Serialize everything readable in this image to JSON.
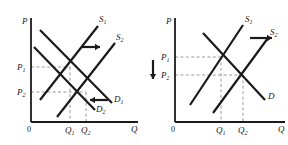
{
  "figure": {
    "type": "supply-demand-diagram-pair",
    "stroke_color": "#1a1a1a",
    "dashed_color": "#9a9a9a",
    "background": "#ffffff"
  },
  "chart_data": {
    "type": "line",
    "title": "",
    "panels": [
      {
        "name": "left-panel",
        "xlabel": "Q",
        "ylabel": "P",
        "origin_label": "0",
        "axis": {
          "x_min": 31,
          "x_max": 138,
          "y_min": 18,
          "y_max": 122
        },
        "price_ticks": [
          {
            "label": "P",
            "sub": "1",
            "y": 67
          },
          {
            "label": "P",
            "sub": "2",
            "y": 92
          }
        ],
        "quantity_ticks": [
          {
            "label": "Q",
            "sub": "1",
            "x": 70
          },
          {
            "label": "Q",
            "sub": "2",
            "x": 86
          }
        ],
        "curves": [
          {
            "name": "S1",
            "label": "S",
            "sub": "1",
            "kind": "supply",
            "x1": 40,
            "y1": 100,
            "x2": 98,
            "y2": 26,
            "label_x": 99,
            "label_y": 22
          },
          {
            "name": "S2",
            "label": "S",
            "sub": "2",
            "kind": "supply",
            "x1": 57,
            "y1": 117,
            "x2": 115,
            "y2": 43,
            "label_x": 116,
            "label_y": 40
          },
          {
            "name": "D1",
            "label": "D",
            "sub": "1",
            "kind": "demand",
            "x1": 40,
            "y1": 30,
            "x2": 112,
            "y2": 103,
            "label_x": 114,
            "label_y": 102
          },
          {
            "name": "D2",
            "label": "D",
            "sub": "2",
            "kind": "demand",
            "x1": 34,
            "y1": 47,
            "x2": 95,
            "y2": 110,
            "label_x": 96,
            "label_y": 112
          }
        ],
        "equilibria": [
          {
            "name": "E1",
            "x": 70,
            "y": 67
          },
          {
            "name": "E2",
            "x": 86,
            "y": 92
          }
        ],
        "arrows": [
          {
            "name": "supply-shift-right-arrow",
            "direction": "right",
            "x1": 82,
            "y1": 47,
            "x2": 100,
            "y2": 47
          },
          {
            "name": "demand-shift-left-arrow",
            "direction": "left",
            "x1": 108,
            "y1": 100,
            "x2": 90,
            "y2": 100
          }
        ]
      },
      {
        "name": "right-panel",
        "xlabel": "Q",
        "ylabel": "P",
        "origin_label": "0",
        "axis": {
          "x_min": 175,
          "x_max": 285,
          "y_min": 18,
          "y_max": 122
        },
        "price_ticks": [
          {
            "label": "P",
            "sub": "1",
            "y": 57
          },
          {
            "label": "P",
            "sub": "2",
            "y": 75
          }
        ],
        "quantity_ticks": [
          {
            "label": "Q",
            "sub": "1",
            "x": 221
          },
          {
            "label": "Q",
            "sub": "2",
            "x": 243
          }
        ],
        "curves": [
          {
            "name": "S1",
            "label": "S",
            "sub": "1",
            "kind": "supply",
            "x1": 190,
            "y1": 105,
            "x2": 243,
            "y2": 25,
            "label_x": 245,
            "label_y": 22
          },
          {
            "name": "S2",
            "label": "S",
            "sub": "2",
            "kind": "supply",
            "x1": 213,
            "y1": 113,
            "x2": 268,
            "y2": 38,
            "label_x": 270,
            "label_y": 35
          },
          {
            "name": "D",
            "label": "D",
            "sub": "",
            "kind": "demand",
            "x1": 203,
            "y1": 33,
            "x2": 265,
            "y2": 100,
            "label_x": 268,
            "label_y": 99
          }
        ],
        "equilibria": [
          {
            "name": "E1",
            "x": 221,
            "y": 57
          },
          {
            "name": "E2",
            "x": 243,
            "y": 75
          }
        ],
        "arrows": [
          {
            "name": "supply-shift-right-arrow",
            "direction": "right",
            "x1": 250,
            "y1": 38,
            "x2": 272,
            "y2": 38
          },
          {
            "name": "price-fall-down-arrow",
            "direction": "down",
            "x1": 153,
            "y1": 60,
            "x2": 153,
            "y2": 79
          }
        ]
      }
    ]
  }
}
